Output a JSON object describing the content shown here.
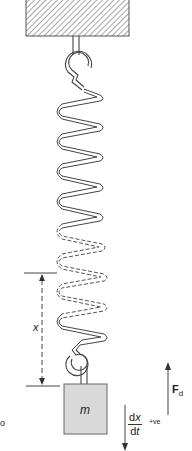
{
  "diagram": {
    "type": "spring-mass system",
    "support": {
      "style": "hatched",
      "fill": "#ffffff",
      "stroke": "#555555"
    },
    "mass": {
      "label": "m",
      "fill": "#d9d9d9"
    },
    "displacement": {
      "label": "x"
    },
    "force": {
      "label_main": "F",
      "label_sub": "d"
    },
    "velocity": {
      "numerator_d": "d",
      "numerator_var": "x",
      "denominator_d": "d",
      "denominator_var": "t",
      "sign_label": "+ve"
    },
    "edge_label": "o"
  },
  "colors": {
    "line": "#444444",
    "mass_fill": "#d9d9d9",
    "background": "#ffffff"
  }
}
